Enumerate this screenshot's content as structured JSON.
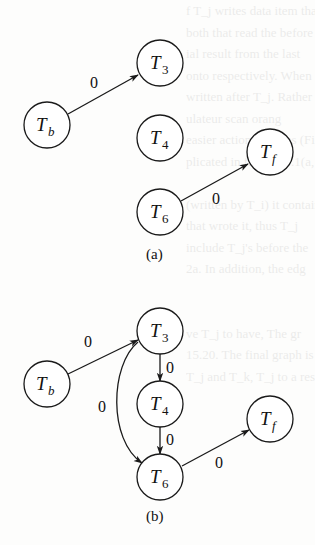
{
  "colors": {
    "ink": "#1a1a1a",
    "paper": "#fdfdfc"
  },
  "background_bleed": {
    "lines": [
      "f T_j writes data item tha",
      "both that read the before",
      "ial result from the last",
      "onto respectively. When",
      "written after T_j. Rather",
      "ulateur scan orang",
      "easier action requires (Figu",
      "plicated in figure 15.1(a,",
      "",
      "(written by T_i) it contains",
      "that wrote it, thus T_j",
      "include T_j's before the",
      "2a. In addition, the edg",
      "",
      "",
      "ve T_j to have, The gr",
      "15.20. The final graph is",
      "T_j and T_k, T_j to a result"
    ]
  },
  "diagram_a": {
    "caption": "(a)",
    "nodes": [
      {
        "id": "Tb",
        "main": "T",
        "sub": "b",
        "sub_italic": true
      },
      {
        "id": "T3",
        "main": "T",
        "sub": "3",
        "sub_italic": false
      },
      {
        "id": "T4",
        "main": "T",
        "sub": "4",
        "sub_italic": false
      },
      {
        "id": "T6",
        "main": "T",
        "sub": "6",
        "sub_italic": false
      },
      {
        "id": "Tf",
        "main": "T",
        "sub": "f",
        "sub_italic": true
      }
    ],
    "edges": [
      {
        "from": "Tb",
        "to": "T3",
        "label": "0"
      },
      {
        "from": "T6",
        "to": "Tf",
        "label": "0"
      }
    ]
  },
  "diagram_b": {
    "caption": "(b)",
    "nodes": [
      {
        "id": "Tb",
        "main": "T",
        "sub": "b",
        "sub_italic": true
      },
      {
        "id": "T3",
        "main": "T",
        "sub": "3",
        "sub_italic": false
      },
      {
        "id": "T4",
        "main": "T",
        "sub": "4",
        "sub_italic": false
      },
      {
        "id": "T6",
        "main": "T",
        "sub": "6",
        "sub_italic": false
      },
      {
        "id": "Tf",
        "main": "T",
        "sub": "f",
        "sub_italic": true
      }
    ],
    "edges": [
      {
        "from": "Tb",
        "to": "T3",
        "label": "0"
      },
      {
        "from": "T3",
        "to": "T4",
        "label": "0"
      },
      {
        "from": "T4",
        "to": "T6",
        "label": "0"
      },
      {
        "from": "T3",
        "to": "T6",
        "label": "0",
        "curved": true
      },
      {
        "from": "T6",
        "to": "Tf",
        "label": "0"
      }
    ]
  }
}
